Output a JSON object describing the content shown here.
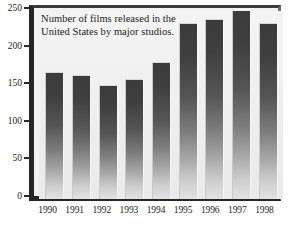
{
  "figure": {
    "top_cropped_text": ". .",
    "caption": "Number of films released in the United States by major studios."
  },
  "chart_data": {
    "type": "bar",
    "title": "",
    "subtitle": "",
    "annotation": "Number of films released in the United States by major studios.",
    "categories": [
      "1990",
      "1991",
      "1992",
      "1993",
      "1994",
      "1995",
      "1996",
      "1997",
      "1998"
    ],
    "values": [
      168,
      163,
      150,
      158,
      181,
      233,
      238,
      251,
      233
    ],
    "series": [
      {
        "name": "Films released",
        "values": [
          168,
          163,
          150,
          158,
          181,
          233,
          238,
          251,
          233
        ]
      }
    ],
    "xlabel": "",
    "ylabel": "",
    "ylim": [
      0,
      250
    ],
    "yticks": [
      0,
      50,
      100,
      150,
      200,
      250
    ],
    "ytick_labels": [
      "0",
      "50",
      "100",
      "150",
      "200",
      "250"
    ],
    "grid": false,
    "legend": false,
    "legend_position": "none",
    "orientation": "vertical",
    "bar_style": "grayscale vertical gradient, dark top to light bottom",
    "colors": {
      "bar_top": "#3b3b3b",
      "bar_bottom": "#e2e2e2",
      "plot_background": "#f1f1f1",
      "frame": "#262626",
      "text": "#1b1b1b",
      "page_background": "#ffffff"
    }
  }
}
